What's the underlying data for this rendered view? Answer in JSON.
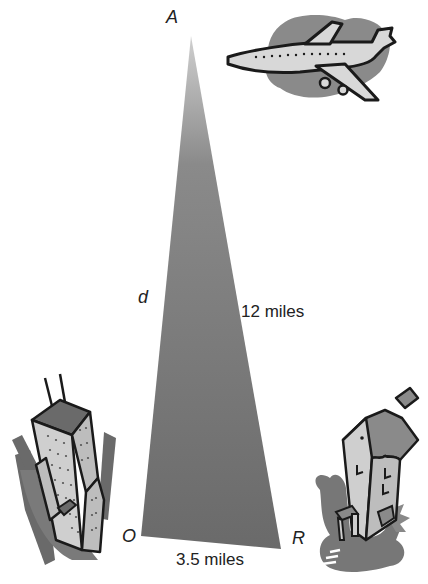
{
  "diagram": {
    "type": "right-triangle word problem",
    "vertices": {
      "apex": "A",
      "bottom_left": "O",
      "bottom_right": "R"
    },
    "sides": {
      "hypotenuse_label": "12 miles",
      "vertical_label": "d",
      "base_label": "3.5 miles"
    },
    "illustrations": {
      "top_right": "airplane",
      "bottom_left": "skyscraper",
      "bottom_right": "house"
    },
    "colors": {
      "triangle_top": "#c4c4c4",
      "triangle_bottom": "#6c6c6c",
      "outline": "#1a1a1a",
      "shadow": "#7a7a7a",
      "fill_light": "#d6d6d6"
    }
  }
}
